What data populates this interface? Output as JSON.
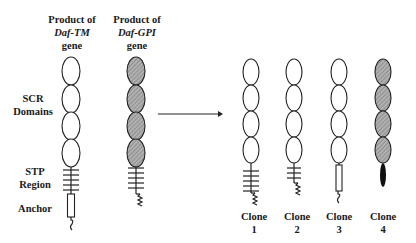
{
  "diagram": {
    "left": {
      "columns": [
        {
          "title_line1": "Product of",
          "title_line2": "Daf-TM",
          "title_line3": "gene",
          "domain_style": "white",
          "stalk": "stp-transmembrane-anchor"
        },
        {
          "title_line1": "Product of",
          "title_line2": "Daf-GPI",
          "title_line3": "gene",
          "domain_style": "shaded",
          "stalk": "stp-gpi"
        }
      ],
      "row_labels": {
        "scr_line1": "SCR",
        "scr_line2": "Domains",
        "stp_line1": "STP",
        "stp_line2": "Region",
        "anchor": "Anchor"
      }
    },
    "arrow": {
      "direction": "right"
    },
    "clones": [
      {
        "label": "Clone",
        "number": "1",
        "domain_style": "white",
        "stalk": "stp-gpi"
      },
      {
        "label": "Clone",
        "number": "2",
        "domain_style": "white",
        "stalk": "short-stp-gpi"
      },
      {
        "label": "Clone",
        "number": "3",
        "domain_style": "white",
        "stalk": "transmembrane-anchor"
      },
      {
        "label": "Clone",
        "number": "4",
        "domain_style": "shaded",
        "stalk": "solid-black-stem"
      }
    ],
    "colors": {
      "shade": "#9a9a9a",
      "line": "#222222",
      "background": "#ffffff"
    }
  }
}
